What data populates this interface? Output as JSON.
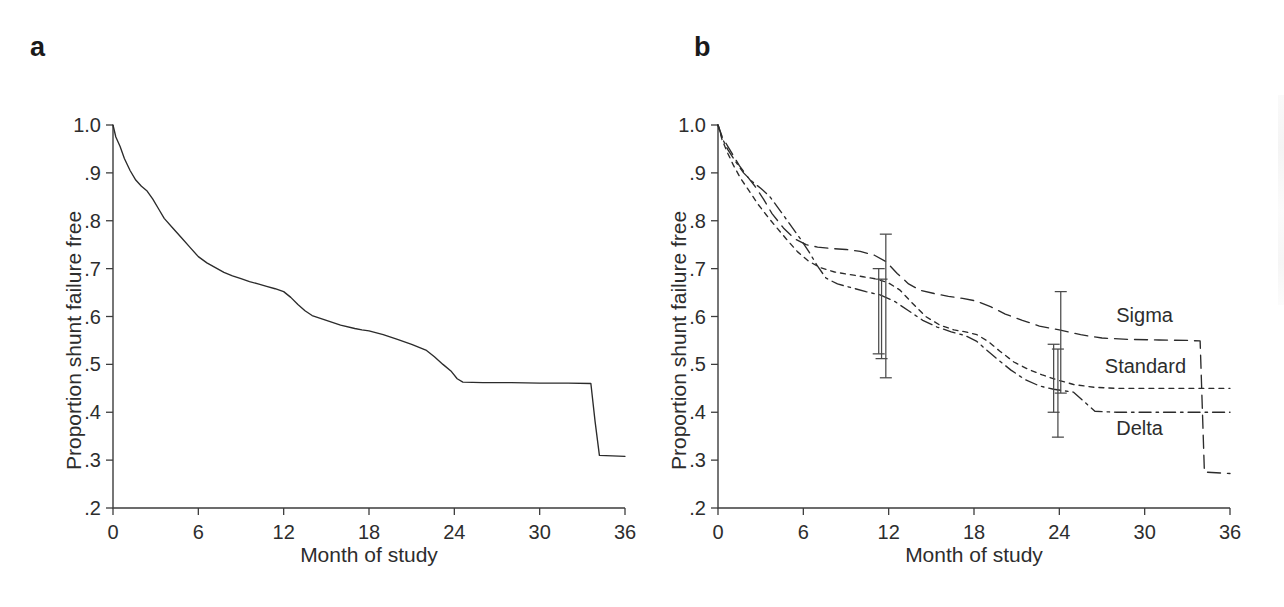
{
  "figure": {
    "background_color": "#ffffff",
    "line_color": "#2b2b2b",
    "text_color": "#2d2d2d"
  },
  "panels": [
    {
      "letter": "a",
      "xlabel": "Month of study",
      "ylabel": "Proportion shunt failure free"
    },
    {
      "letter": "b",
      "xlabel": "Month of study",
      "ylabel": "Proportion shunt failure free"
    }
  ],
  "series_labels": {
    "sigma": "Sigma",
    "standard": "Standard",
    "delta": "Delta"
  },
  "chart_data": [
    {
      "type": "line",
      "panel": "a",
      "title": "",
      "xlabel": "Month of study",
      "ylabel": "Proportion shunt failure free",
      "xlim": [
        0,
        36
      ],
      "ylim": [
        0.2,
        1.0
      ],
      "xticks": [
        0,
        6,
        12,
        18,
        24,
        30,
        36
      ],
      "xticklabels": [
        "0",
        "6",
        "12",
        "18",
        "24",
        "30",
        "36"
      ],
      "yticks": [
        0.2,
        0.3,
        0.4,
        0.5,
        0.6,
        0.7,
        0.8,
        0.9,
        1.0
      ],
      "yticklabels": [
        ".2",
        ".3",
        ".4",
        ".5",
        ".6",
        ".7",
        ".8",
        ".9",
        "1.0"
      ],
      "grid": false,
      "legend": "none",
      "series": [
        {
          "name": "All shunts",
          "style": "solid",
          "x": [
            0,
            0.2,
            0.5,
            0.8,
            1.2,
            1.6,
            2.0,
            2.4,
            2.8,
            3.2,
            3.6,
            4.2,
            4.8,
            5.4,
            6.0,
            6.6,
            7.2,
            7.8,
            8.4,
            9.0,
            9.6,
            10.2,
            10.8,
            11.4,
            12.0,
            12.5,
            13.0,
            13.5,
            14.0,
            15.0,
            16.0,
            17.0,
            17.5,
            18.0,
            19.0,
            20.0,
            21.0,
            22.0,
            22.6,
            23.2,
            23.8,
            24.2,
            24.6,
            26.0,
            28.0,
            30.0,
            32.0,
            33.6,
            33.9,
            34.2,
            36.0
          ],
          "y": [
            1.0,
            0.975,
            0.955,
            0.93,
            0.905,
            0.885,
            0.872,
            0.862,
            0.845,
            0.825,
            0.805,
            0.785,
            0.765,
            0.745,
            0.725,
            0.712,
            0.702,
            0.692,
            0.685,
            0.679,
            0.673,
            0.668,
            0.663,
            0.658,
            0.652,
            0.64,
            0.625,
            0.612,
            0.602,
            0.592,
            0.582,
            0.575,
            0.572,
            0.57,
            0.562,
            0.552,
            0.542,
            0.53,
            0.516,
            0.5,
            0.485,
            0.47,
            0.463,
            0.462,
            0.462,
            0.461,
            0.461,
            0.46,
            0.38,
            0.31,
            0.308
          ]
        }
      ]
    },
    {
      "type": "line",
      "panel": "b",
      "title": "",
      "xlabel": "Month of study",
      "ylabel": "Proportion shunt failure free",
      "xlim": [
        0,
        36
      ],
      "ylim": [
        0.2,
        1.0
      ],
      "xticks": [
        0,
        6,
        12,
        18,
        24,
        30,
        36
      ],
      "xticklabels": [
        "0",
        "6",
        "12",
        "18",
        "24",
        "30",
        "36"
      ],
      "yticks": [
        0.2,
        0.3,
        0.4,
        0.5,
        0.6,
        0.7,
        0.8,
        0.9,
        1.0
      ],
      "yticklabels": [
        ".2",
        ".3",
        ".4",
        ".5",
        ".6",
        ".7",
        ".8",
        ".9",
        "1.0"
      ],
      "grid": false,
      "legend": "inline-right",
      "series": [
        {
          "name": "Sigma",
          "style": "long-dash",
          "x": [
            0,
            0.3,
            0.7,
            1.1,
            1.5,
            2.0,
            2.6,
            3.2,
            3.8,
            4.6,
            5.4,
            6.2,
            7.0,
            8.0,
            9.0,
            10.0,
            11.0,
            11.8,
            12.6,
            13.4,
            14.2,
            15.2,
            16.2,
            17.2,
            18.2,
            19.2,
            20.2,
            21.4,
            22.6,
            24.0,
            25.5,
            27.0,
            29.0,
            31.0,
            33.0,
            33.9,
            34.2,
            36.0
          ],
          "y": [
            1.0,
            0.975,
            0.955,
            0.935,
            0.915,
            0.895,
            0.872,
            0.845,
            0.815,
            0.785,
            0.762,
            0.75,
            0.745,
            0.742,
            0.74,
            0.736,
            0.728,
            0.715,
            0.69,
            0.668,
            0.655,
            0.648,
            0.642,
            0.638,
            0.632,
            0.62,
            0.605,
            0.592,
            0.58,
            0.572,
            0.562,
            0.555,
            0.552,
            0.551,
            0.55,
            0.549,
            0.275,
            0.272
          ]
        },
        {
          "name": "Standard",
          "style": "short-dash",
          "x": [
            0,
            0.3,
            0.7,
            1.1,
            1.6,
            2.2,
            2.8,
            3.4,
            4.0,
            4.8,
            5.6,
            6.4,
            7.2,
            8.2,
            9.2,
            10.2,
            11.2,
            12.0,
            12.8,
            13.6,
            14.6,
            15.6,
            16.6,
            17.4,
            18.2,
            19.0,
            19.8,
            20.8,
            21.8,
            22.8,
            23.8,
            25.0,
            26.5,
            28.0,
            30.0,
            32.0,
            34.0,
            36.0
          ],
          "y": [
            1.0,
            0.968,
            0.94,
            0.915,
            0.888,
            0.862,
            0.835,
            0.812,
            0.79,
            0.762,
            0.735,
            0.715,
            0.702,
            0.693,
            0.688,
            0.683,
            0.678,
            0.67,
            0.655,
            0.63,
            0.6,
            0.582,
            0.572,
            0.568,
            0.562,
            0.548,
            0.528,
            0.505,
            0.49,
            0.478,
            0.468,
            0.458,
            0.452,
            0.45,
            0.45,
            0.45,
            0.45,
            0.45
          ]
        },
        {
          "name": "Delta",
          "style": "dash-dot",
          "x": [
            0,
            0.3,
            0.7,
            1.2,
            1.8,
            2.4,
            3.0,
            3.6,
            4.2,
            5.0,
            5.8,
            6.4,
            7.0,
            7.6,
            8.4,
            9.4,
            10.4,
            11.4,
            12.4,
            13.4,
            14.4,
            15.4,
            16.4,
            17.4,
            18.2,
            18.8,
            19.6,
            20.6,
            21.6,
            22.6,
            23.6,
            25.0,
            26.5,
            28.0,
            30.0,
            32.0,
            34.0,
            36.0
          ],
          "y": [
            1.0,
            0.972,
            0.948,
            0.925,
            0.9,
            0.882,
            0.868,
            0.852,
            0.828,
            0.795,
            0.762,
            0.735,
            0.705,
            0.68,
            0.668,
            0.66,
            0.652,
            0.645,
            0.632,
            0.612,
            0.592,
            0.578,
            0.568,
            0.56,
            0.548,
            0.532,
            0.512,
            0.488,
            0.468,
            0.455,
            0.448,
            0.442,
            0.402,
            0.4,
            0.4,
            0.4,
            0.4,
            0.4
          ]
        }
      ],
      "error_bars": [
        {
          "series": "Sigma",
          "x": 11.8,
          "y": 0.62,
          "lower": 0.472,
          "upper": 0.772
        },
        {
          "series": "Standard",
          "x": 11.3,
          "y": 0.602,
          "lower": 0.522,
          "upper": 0.7
        },
        {
          "series": "Delta",
          "x": 11.5,
          "y": 0.592,
          "lower": 0.512,
          "upper": 0.678
        },
        {
          "series": "Sigma",
          "x": 24.1,
          "y": 0.572,
          "lower": 0.44,
          "upper": 0.652
        },
        {
          "series": "Standard",
          "x": 23.6,
          "y": 0.468,
          "lower": 0.4,
          "upper": 0.542
        },
        {
          "series": "Delta",
          "x": 23.9,
          "y": 0.448,
          "lower": 0.348,
          "upper": 0.532
        }
      ]
    }
  ]
}
